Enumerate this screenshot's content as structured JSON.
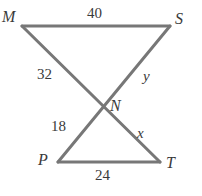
{
  "figure": {
    "line_color": "#777777",
    "line_width": 3,
    "text_color": "#3a3a3a",
    "background": "#ffffff",
    "width": 202,
    "height": 196
  },
  "vertices": [
    {
      "id": "M",
      "label": "M",
      "x": 22,
      "y": 26
    },
    {
      "id": "S",
      "label": "S",
      "x": 170,
      "y": 26
    },
    {
      "id": "N",
      "label": "N",
      "x": 104,
      "y": 105
    },
    {
      "id": "P",
      "label": "P",
      "x": 58,
      "y": 162
    },
    {
      "id": "T",
      "label": "T",
      "x": 160,
      "y": 162
    }
  ],
  "segments": [
    {
      "id": "MS",
      "from": "M",
      "to": "S"
    },
    {
      "id": "MT",
      "from": "M",
      "to": "T"
    },
    {
      "id": "SP",
      "from": "S",
      "to": "P"
    },
    {
      "id": "PT",
      "from": "P",
      "to": "T"
    }
  ],
  "measures": {
    "MS": "40",
    "MN": "32",
    "NS": "y",
    "NP": "18",
    "NT": "x",
    "PT": "24"
  }
}
